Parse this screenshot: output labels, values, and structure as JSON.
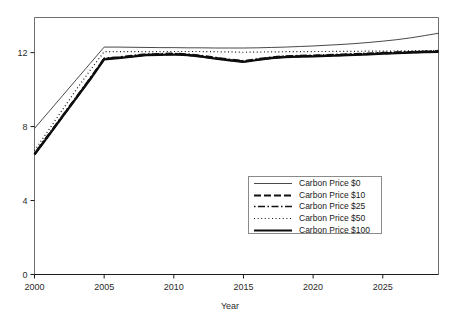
{
  "chart_data": {
    "type": "line",
    "title": "",
    "xlabel": "Year",
    "ylabel": "",
    "xlim": [
      2000,
      2029
    ],
    "ylim": [
      0,
      13.9
    ],
    "grid": false,
    "legend_position": "inside-lower-right",
    "xticks": [
      2000,
      2005,
      2010,
      2015,
      2020,
      2025
    ],
    "xtick_labels": [
      "2000",
      "2005",
      "2010",
      "2015",
      "2020",
      "2025"
    ],
    "yticks": [
      0,
      4,
      8,
      12
    ],
    "ytick_labels": [
      "0",
      "4",
      "8",
      "12"
    ],
    "x": [
      2000,
      2001,
      2002,
      2003,
      2004,
      2005,
      2006,
      2007,
      2008,
      2009,
      2010,
      2011,
      2012,
      2013,
      2014,
      2015,
      2016,
      2017,
      2018,
      2019,
      2020,
      2021,
      2022,
      2023,
      2024,
      2025,
      2026,
      2027,
      2028,
      2029
    ],
    "series": [
      {
        "name": "Carbon Price $0",
        "style": "thin-solid",
        "color": "#1a1a1a",
        "width": 0.8,
        "dash": "none",
        "values": [
          7.9,
          8.78,
          9.66,
          10.54,
          11.42,
          12.3,
          12.3,
          12.29,
          12.28,
          12.27,
          12.27,
          12.26,
          12.26,
          12.25,
          12.25,
          12.25,
          12.26,
          12.28,
          12.3,
          12.33,
          12.36,
          12.4,
          12.44,
          12.49,
          12.55,
          12.62,
          12.7,
          12.8,
          12.92,
          13.05
        ]
      },
      {
        "name": "Carbon Price $10",
        "style": "thick-dashed",
        "color": "#111111",
        "width": 2.2,
        "dash": "7,3",
        "values": [
          6.5,
          7.52,
          8.54,
          9.56,
          10.58,
          11.66,
          11.72,
          11.8,
          11.88,
          11.9,
          11.92,
          11.88,
          11.8,
          11.7,
          11.6,
          11.52,
          11.62,
          11.72,
          11.78,
          11.8,
          11.82,
          11.84,
          11.87,
          11.9,
          11.93,
          11.96,
          11.99,
          12.02,
          12.04,
          12.06
        ]
      },
      {
        "name": "Carbon Price $25",
        "style": "dash-dot",
        "color": "#111111",
        "width": 1.6,
        "dash": "1.5,2.5,7,2.5",
        "values": [
          6.55,
          7.57,
          8.59,
          9.61,
          10.63,
          11.7,
          11.76,
          11.84,
          11.92,
          11.94,
          11.96,
          11.92,
          11.84,
          11.74,
          11.64,
          11.56,
          11.66,
          11.76,
          11.82,
          11.84,
          11.86,
          11.88,
          11.91,
          11.94,
          11.97,
          12.0,
          12.03,
          12.05,
          12.07,
          12.09
        ]
      },
      {
        "name": "Carbon Price $50",
        "style": "dotted",
        "color": "#111111",
        "width": 1.2,
        "dash": "1,2.6",
        "values": [
          6.7,
          7.8,
          8.9,
          10.0,
          11.05,
          12.05,
          12.05,
          12.05,
          12.05,
          12.05,
          12.06,
          12.06,
          12.06,
          12.05,
          12.04,
          12.02,
          12.03,
          12.04,
          12.05,
          12.05,
          12.06,
          12.06,
          12.07,
          12.07,
          12.08,
          12.08,
          12.09,
          12.1,
          12.11,
          12.12
        ]
      },
      {
        "name": "Carbon Price $100",
        "style": "thick-solid",
        "color": "#0d0d0d",
        "width": 2.2,
        "dash": "none",
        "values": [
          6.48,
          7.5,
          8.52,
          9.54,
          10.56,
          11.64,
          11.7,
          11.78,
          11.86,
          11.88,
          11.9,
          11.86,
          11.78,
          11.68,
          11.58,
          11.5,
          11.6,
          11.7,
          11.76,
          11.78,
          11.8,
          11.82,
          11.85,
          11.88,
          11.91,
          11.94,
          11.97,
          12.0,
          12.02,
          12.04
        ]
      }
    ]
  },
  "legend": {
    "entries": [
      {
        "label": "Carbon Price $0"
      },
      {
        "label": "Carbon Price $10"
      },
      {
        "label": "Carbon Price $25"
      },
      {
        "label": "Carbon Price $50"
      },
      {
        "label": "Carbon Price $100"
      }
    ]
  },
  "axis": {
    "x_title": "Year"
  },
  "colors": {
    "frame": "#6f6f6f",
    "ink": "#1a1a1a",
    "legend_border": "#8a8a8a",
    "background": "#ffffff"
  }
}
